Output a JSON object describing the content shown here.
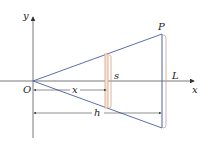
{
  "diagram": {
    "labels": {
      "y_axis": "y",
      "x_axis": "x",
      "origin": "O",
      "apex": "P",
      "cross_section": "s",
      "length": "L",
      "distance_x": "x",
      "height": "h"
    },
    "colors": {
      "axes": "#333333",
      "cone_edges": "#5a6fb0",
      "cross_section": "#d9a07a",
      "brace": "#c9a58a",
      "dimension": "#444444"
    }
  }
}
